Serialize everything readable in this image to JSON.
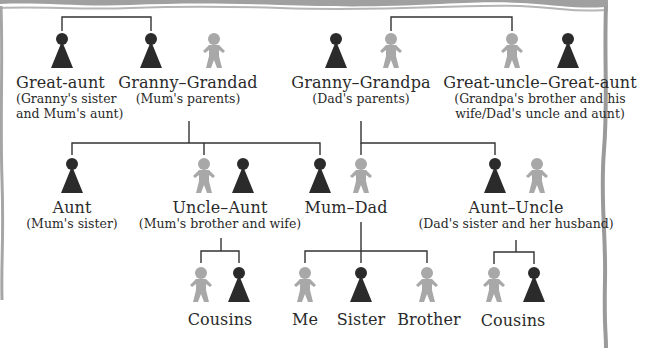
{
  "diagram": {
    "colors": {
      "female": "#2b2b2b",
      "male": "#a8a8a8",
      "line": "#333333",
      "border": "#9a9a9a",
      "background": "#ffffff"
    },
    "legend_semantics": {
      "female-icon": "dark cone figure",
      "male-icon": "light grey gingerbread-style figure"
    },
    "generations": [
      {
        "level": "grandparents",
        "groups": [
          {
            "id": "great-aunt-mum",
            "name": "Great-aunt",
            "sub": [
              "(Granny's sister",
              "and Mum's aunt)"
            ],
            "members": [
              "female"
            ]
          },
          {
            "id": "granny-grandad",
            "name": "Granny–Grandad",
            "sub": [
              "(Mum's parents)"
            ],
            "members": [
              "female",
              "male"
            ]
          },
          {
            "id": "granny-grandpa",
            "name": "Granny–Grandpa",
            "sub": [
              "(Dad's parents)"
            ],
            "members": [
              "female",
              "male"
            ]
          },
          {
            "id": "great-uncle-great-aunt",
            "name": "Great-uncle–Great-aunt",
            "sub": [
              "(Grandpa's brother and his",
              "wife/Dad's uncle and aunt)"
            ],
            "members": [
              "male",
              "female"
            ]
          }
        ]
      },
      {
        "level": "parents",
        "groups": [
          {
            "id": "aunt",
            "name": "Aunt",
            "sub": [
              "(Mum's sister)"
            ],
            "members": [
              "female"
            ]
          },
          {
            "id": "uncle-aunt",
            "name": "Uncle–Aunt",
            "sub": [
              "(Mum's brother and wife)"
            ],
            "members": [
              "male",
              "female"
            ]
          },
          {
            "id": "mum-dad",
            "name": "Mum–Dad",
            "sub": [],
            "members": [
              "female",
              "male"
            ]
          },
          {
            "id": "aunt-uncle",
            "name": "Aunt–Uncle",
            "sub": [
              "(Dad's sister and her husband)"
            ],
            "members": [
              "female",
              "male"
            ]
          }
        ]
      },
      {
        "level": "children",
        "groups": [
          {
            "id": "cousins-mum",
            "name": "Cousins",
            "members": [
              "male",
              "female"
            ]
          },
          {
            "id": "me",
            "name": "Me",
            "members": [
              "male"
            ]
          },
          {
            "id": "sister",
            "name": "Sister",
            "members": [
              "female"
            ]
          },
          {
            "id": "brother",
            "name": "Brother",
            "members": [
              "male"
            ]
          },
          {
            "id": "cousins-dad",
            "name": "Cousins",
            "members": [
              "male",
              "female"
            ]
          }
        ]
      }
    ],
    "edges": [
      {
        "type": "siblings",
        "between": [
          "Great-aunt",
          "Granny (Mum's side)"
        ]
      },
      {
        "type": "siblings",
        "between": [
          "Grandpa",
          "Great-uncle"
        ]
      },
      {
        "type": "children",
        "parents": "Granny–Grandad",
        "children": [
          "Aunt",
          "Uncle",
          "Mum"
        ]
      },
      {
        "type": "children",
        "parents": "Granny–Grandpa",
        "children": [
          "Dad",
          "Aunt (Dad's sister)"
        ]
      },
      {
        "type": "children",
        "parents": "Uncle–Aunt",
        "children": [
          "Cousin (boy)",
          "Cousin (girl)"
        ]
      },
      {
        "type": "children",
        "parents": "Mum–Dad",
        "children": [
          "Me",
          "Sister",
          "Brother"
        ]
      },
      {
        "type": "children",
        "parents": "Aunt–Uncle",
        "children": [
          "Cousin (boy)",
          "Cousin (girl)"
        ]
      }
    ]
  },
  "labels": {
    "great_aunt": {
      "name": "Great-aunt",
      "sub1": "(Granny's sister",
      "sub2": "and Mum's aunt)"
    },
    "granny_grandad": {
      "name": "Granny–Grandad",
      "sub1": "(Mum's parents)"
    },
    "granny_grandpa": {
      "name": "Granny–Grandpa",
      "sub1": "(Dad's parents)"
    },
    "great_uncle_aunt": {
      "name": "Great-uncle–Great-aunt",
      "sub1": "(Grandpa's brother and his",
      "sub2": "wife/Dad's uncle and aunt)"
    },
    "aunt": {
      "name": "Aunt",
      "sub1": "(Mum's sister)"
    },
    "uncle_aunt": {
      "name": "Uncle–Aunt",
      "sub1": "(Mum's brother and wife)"
    },
    "mum_dad": {
      "name": "Mum–Dad"
    },
    "aunt_uncle": {
      "name": "Aunt–Uncle",
      "sub1": "(Dad's sister and her husband)"
    },
    "cousins_left": {
      "name": "Cousins"
    },
    "me": {
      "name": "Me"
    },
    "sister": {
      "name": "Sister"
    },
    "brother": {
      "name": "Brother"
    },
    "cousins_right": {
      "name": "Cousins"
    }
  }
}
